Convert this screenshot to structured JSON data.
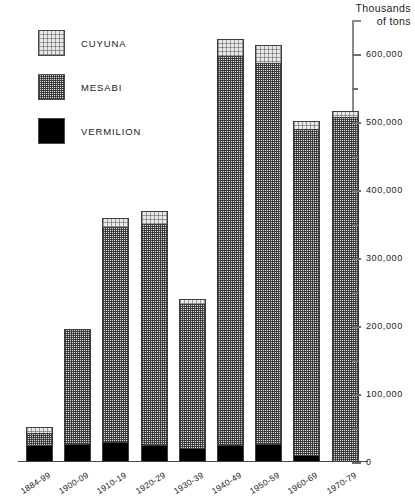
{
  "chart_data": {
    "type": "bar",
    "subtype": "stacked",
    "title": "",
    "axis_title_line1": "Thousands",
    "axis_title_line2": "of tons",
    "xlabel": "",
    "ylabel": "Thousands of tons",
    "ylim": [
      0,
      650000
    ],
    "ytick_interval_major": 100000,
    "ytick_interval_minor": 50000,
    "grid": false,
    "legend_position": "upper-left",
    "categories": [
      "1884-99",
      "1900-09",
      "1910-19",
      "1920-29",
      "1930-39",
      "1940-49",
      "1950-59",
      "1960-69",
      "1970-79"
    ],
    "series": [
      {
        "name": "VERMILION",
        "color": "#000000",
        "values": [
          25000,
          27000,
          29000,
          25000,
          20000,
          25000,
          27000,
          10000,
          0
        ]
      },
      {
        "name": "MESABI",
        "color": "#d2d2d2",
        "values": [
          18000,
          169000,
          317000,
          325000,
          213000,
          572000,
          560000,
          479000,
          508000
        ]
      },
      {
        "name": "CUYUNA",
        "color": "#e9e9e9",
        "values": [
          8000,
          0,
          13000,
          19000,
          7000,
          25000,
          26000,
          12000,
          8000
        ]
      }
    ],
    "totals": [
      51000,
      196000,
      359000,
      369000,
      240000,
      622000,
      613000,
      501000,
      516000
    ],
    "ytick_labels": [
      "0",
      "100,000",
      "200,000",
      "300,000",
      "400,000",
      "500,000",
      "600,000"
    ],
    "ytick_values": [
      0,
      100000,
      200000,
      300000,
      400000,
      500000,
      600000
    ]
  },
  "legend": {
    "items": [
      {
        "label": "CUYUNA",
        "pattern": "cuyuna"
      },
      {
        "label": "MESABI",
        "pattern": "mesabi"
      },
      {
        "label": "VERMILION",
        "pattern": "vermilion"
      }
    ]
  }
}
